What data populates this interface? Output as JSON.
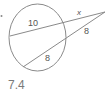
{
  "diagram": {
    "labels": {
      "top_secant_internal": "10",
      "top_secant_external": "x",
      "bottom_secant_external": "8",
      "bottom_secant_internal": "8"
    },
    "answer": "7.4",
    "colors": {
      "stroke": "#8a8a8a",
      "text": "#555555",
      "answer": "#7a7a7a"
    }
  }
}
